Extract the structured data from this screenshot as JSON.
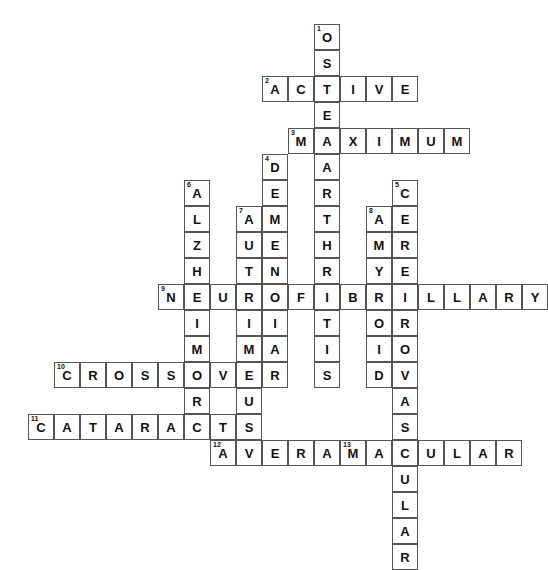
{
  "puzzle": {
    "title": "Crossword Puzzle",
    "grid": {
      "origin_x": 28,
      "origin_y": 24,
      "cell_size": 26,
      "cols": 19,
      "rows": 18
    },
    "entries": [
      {
        "number": "1",
        "answer": "OSTEOARTHRITIS",
        "direction": "down",
        "row": 0,
        "col": 11,
        "length": 14
      },
      {
        "number": "2",
        "answer": "ACTIVE",
        "direction": "across",
        "row": 2,
        "col": 9,
        "length": 6
      },
      {
        "number": "3",
        "answer": "MAXIMUM",
        "direction": "across",
        "row": 4,
        "col": 10,
        "length": 7
      },
      {
        "number": "4",
        "answer": "DEMENTIA",
        "direction": "down",
        "row": 5,
        "col": 9,
        "length": 8
      },
      {
        "number": "5",
        "answer": "CEREBROVASCULAR",
        "direction": "down",
        "row": 6,
        "col": 14,
        "length": 15
      },
      {
        "number": "6",
        "answer": "ALZHEIMERS",
        "direction": "down",
        "row": 6,
        "col": 6,
        "length": 10
      },
      {
        "number": "7",
        "answer": "AUTOIMMUNE",
        "direction": "down",
        "row": 7,
        "col": 8,
        "length": 10
      },
      {
        "number": "8",
        "answer": "AMYLOID",
        "direction": "down",
        "row": 7,
        "col": 13,
        "length": 7
      },
      {
        "number": "9",
        "answer": "NEUROFIBRILLARY",
        "direction": "across",
        "row": 10,
        "col": 5,
        "length": 15
      },
      {
        "number": "10",
        "answer": "CROSSOVER",
        "direction": "across",
        "row": 13,
        "col": 1,
        "length": 9
      },
      {
        "number": "11",
        "answer": "CATARACTS",
        "direction": "across",
        "row": 15,
        "col": 0,
        "length": 9
      },
      {
        "number": "12",
        "answer": "AVERAGE",
        "direction": "across",
        "row": 16,
        "col": 7,
        "length": 7
      },
      {
        "number": "13",
        "answer": "MACULAR",
        "direction": "across",
        "row": 16,
        "col": 12,
        "length": 7
      }
    ],
    "colors": {
      "cell_border": "#555555",
      "cell_background": "#ffffff",
      "letter": "#111111",
      "clue_number": "#111111",
      "page_background": "#ffffff"
    }
  }
}
